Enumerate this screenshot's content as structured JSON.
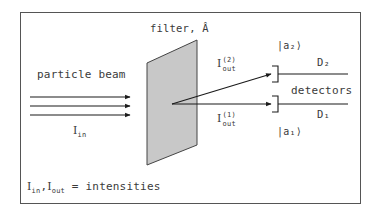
{
  "diagram": {
    "type": "physics-schematic",
    "labels": {
      "beam": "particle beam",
      "filter": "filter, ",
      "filter_operator": "Â",
      "input_intensity_symbol": "I",
      "input_intensity_sub": "in",
      "out2_symbol": "I",
      "out2_sup": "(2)",
      "out2_sub": "out",
      "out1_symbol": "I",
      "out1_sup": "(1)",
      "out1_sub": "out",
      "ket2": "|a₂⟩",
      "ket1": "|a₁⟩",
      "detector2": "D₂",
      "detector1": "D₁",
      "detectors": "detectors",
      "legend_I": "I",
      "legend_in": "in",
      "legend_sep": ",",
      "legend_I2": "I",
      "legend_out": "out",
      "legend_text": " = intensities"
    },
    "colors": {
      "line": "#1a1a1a",
      "frame": "#555555",
      "filter_fill": "#c8c8c8",
      "filter_edge": "#444444",
      "text": "#3a3a3a"
    },
    "nodes": [
      {
        "id": "beam",
        "label": "particle beam"
      },
      {
        "id": "filter",
        "label": "filter, Â"
      },
      {
        "id": "D1",
        "label": "D₁",
        "state": "|a₁⟩"
      },
      {
        "id": "D2",
        "label": "D₂",
        "state": "|a₂⟩"
      }
    ],
    "edges": [
      {
        "from": "beam",
        "to": "filter",
        "label": "I_in",
        "count": 3
      },
      {
        "from": "filter",
        "to": "D2",
        "label": "I_out^(2)"
      },
      {
        "from": "filter",
        "to": "D1",
        "label": "I_out^(1)"
      }
    ]
  }
}
